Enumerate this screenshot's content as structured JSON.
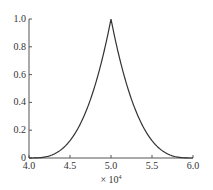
{
  "chart_data": {
    "type": "line",
    "title": "",
    "xlabel": "× 10⁴",
    "ylabel": "",
    "xlim": [
      4.0,
      6.0
    ],
    "ylim": [
      0,
      1.0
    ],
    "x_ticks": [
      "4.0",
      "4.5",
      "5.0",
      "5.5",
      "6.0"
    ],
    "y_ticks": [
      "0",
      "0.2",
      "0.4",
      "0.6",
      "0.8",
      "1.0"
    ],
    "grid": false,
    "legend": null,
    "series": [
      {
        "name": "peak",
        "x": [
          4.0,
          4.1,
          4.2,
          4.25,
          4.3,
          4.4,
          4.5,
          4.6,
          4.7,
          4.8,
          4.9,
          5.0,
          5.1,
          5.2,
          5.3,
          5.4,
          5.5,
          5.6,
          5.7,
          5.75,
          5.8,
          5.9,
          6.0
        ],
        "y": [
          0.0,
          0.001,
          0.008,
          0.016,
          0.027,
          0.064,
          0.125,
          0.216,
          0.343,
          0.512,
          0.729,
          1.0,
          0.729,
          0.512,
          0.343,
          0.216,
          0.125,
          0.064,
          0.027,
          0.016,
          0.008,
          0.001,
          0.0
        ]
      }
    ]
  },
  "axis": {
    "x_multiplier": "× 10",
    "x_exponent": "4"
  }
}
